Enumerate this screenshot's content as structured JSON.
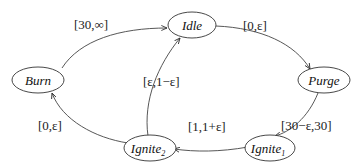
{
  "diagram": {
    "type": "timed-automaton",
    "nodes": [
      {
        "id": "idle",
        "label": "Idle",
        "subscript": ""
      },
      {
        "id": "purge",
        "label": "Purge",
        "subscript": ""
      },
      {
        "id": "ignite1",
        "label": "Ignite",
        "subscript": "1"
      },
      {
        "id": "ignite2",
        "label": "Ignite",
        "subscript": "2"
      },
      {
        "id": "burn",
        "label": "Burn",
        "subscript": ""
      }
    ],
    "edges": [
      {
        "from": "burn",
        "to": "idle",
        "label": "[30,∞]"
      },
      {
        "from": "idle",
        "to": "purge",
        "label": "[0,ε]"
      },
      {
        "from": "purge",
        "to": "ignite1",
        "label": "[30−ε,30]"
      },
      {
        "from": "ignite1",
        "to": "ignite2",
        "label": "[1,1+ε]"
      },
      {
        "from": "ignite2",
        "to": "idle",
        "label": "[ε,1−ε]"
      },
      {
        "from": "ignite2",
        "to": "burn",
        "label": "[0,ε]"
      }
    ],
    "colors": {
      "stroke": "#333333",
      "text": "#111111",
      "background": "#ffffff"
    }
  }
}
